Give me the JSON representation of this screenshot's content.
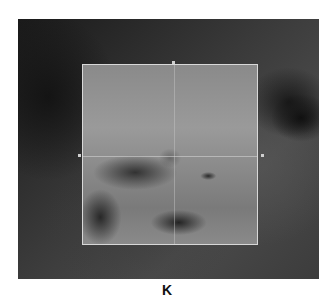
{
  "figure": {
    "panel_label": "K",
    "image_description": "Retinal fundus image with OCT scan area overlay",
    "overlay": {
      "type": "scan-box-with-crosshair",
      "line_color": "#d8d8d8"
    }
  }
}
